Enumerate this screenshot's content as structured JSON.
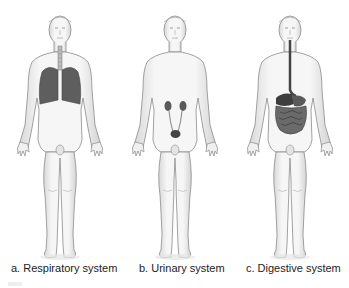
{
  "figure": {
    "panels": [
      {
        "id": "a",
        "label": "a.  Respiratory system",
        "system": "respiratory",
        "organs": [
          "trachea",
          "lungs"
        ]
      },
      {
        "id": "b",
        "label": "b. Urinary system",
        "system": "urinary",
        "organs": [
          "kidneys",
          "ureters",
          "bladder"
        ]
      },
      {
        "id": "c",
        "label": "c. Digestive system",
        "system": "digestive",
        "organs": [
          "esophagus",
          "stomach",
          "liver",
          "intestines"
        ]
      }
    ],
    "colors": {
      "background": "#ffffff",
      "body_outline": "#9a9a9a",
      "body_fill": "#f2f2f2",
      "organ": "#4a4a4a",
      "text": "#222222"
    }
  }
}
